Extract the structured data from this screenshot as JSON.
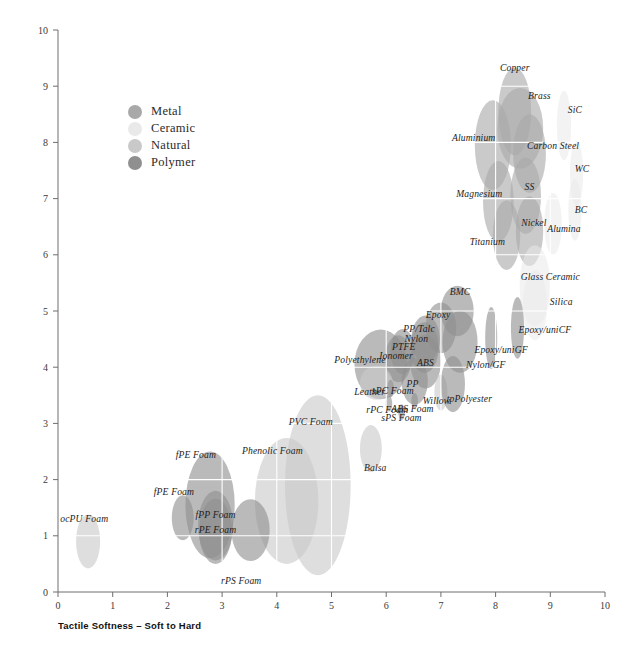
{
  "chart_data": {
    "type": "scatter",
    "title": "",
    "xlabel": "Tactile Softness – Soft to Hard",
    "ylabel": "Tactile Warmth – Warm to Cold",
    "xlim": [
      0,
      10
    ],
    "ylim": [
      0,
      10
    ],
    "xticks": [
      "0",
      "1",
      "2",
      "3",
      "4",
      "5",
      "6",
      "7",
      "8",
      "9",
      "10"
    ],
    "yticks": [
      "0",
      "1",
      "2",
      "3",
      "4",
      "5",
      "6",
      "7",
      "8",
      "9",
      "10"
    ],
    "grid": true,
    "grid_color": "#ffffff",
    "legend_position": "upper-left-inset",
    "note": "Bubble (ellipse) chart; each material is an ellipse whose width/height encode property ranges. Values read off the axes.",
    "legend": [
      {
        "label": "Metal",
        "color": "#a9a9a9"
      },
      {
        "label": "Ceramic",
        "color": "#e9e9e9"
      },
      {
        "label": "Natural",
        "color": "#c9c9c9"
      },
      {
        "label": "Polymer",
        "color": "#8f8f8f"
      }
    ],
    "categories": [
      "Metal",
      "Ceramic",
      "Natural",
      "Polymer"
    ],
    "points": [
      {
        "label": "Copper",
        "category": "Metal",
        "x": 8.35,
        "y": 8.55,
        "rx": 0.3,
        "ry": 0.78,
        "lx": 8.35,
        "ly": 9.35
      },
      {
        "label": "Brass",
        "category": "Metal",
        "x": 8.45,
        "y": 8.25,
        "rx": 0.42,
        "ry": 0.72,
        "lx": 8.8,
        "ly": 8.85
      },
      {
        "label": "Aluminium",
        "category": "Metal",
        "x": 7.95,
        "y": 7.95,
        "rx": 0.33,
        "ry": 0.8,
        "lx": 7.6,
        "ly": 8.1
      },
      {
        "label": "Carbon Steel",
        "category": "Metal",
        "x": 8.62,
        "y": 7.8,
        "rx": 0.3,
        "ry": 0.7,
        "lx": 9.05,
        "ly": 7.95
      },
      {
        "label": "Magnesium",
        "category": "Metal",
        "x": 8.05,
        "y": 6.95,
        "rx": 0.28,
        "ry": 0.72,
        "lx": 7.7,
        "ly": 7.1
      },
      {
        "label": "SS",
        "category": "Metal",
        "x": 8.55,
        "y": 7.05,
        "rx": 0.28,
        "ry": 0.68,
        "lx": 8.62,
        "ly": 7.22
      },
      {
        "label": "Nickel",
        "category": "Metal",
        "x": 8.62,
        "y": 6.42,
        "rx": 0.25,
        "ry": 0.62,
        "lx": 8.7,
        "ly": 6.58
      },
      {
        "label": "Titanium",
        "category": "Metal",
        "x": 8.2,
        "y": 6.35,
        "rx": 0.25,
        "ry": 0.62,
        "lx": 7.85,
        "ly": 6.25
      },
      {
        "label": "SiC",
        "category": "Ceramic",
        "x": 9.25,
        "y": 8.3,
        "rx": 0.13,
        "ry": 0.62,
        "lx": 9.45,
        "ly": 8.6
      },
      {
        "label": "WC",
        "category": "Ceramic",
        "x": 9.48,
        "y": 7.45,
        "rx": 0.12,
        "ry": 0.58,
        "lx": 9.58,
        "ly": 7.55
      },
      {
        "label": "BC",
        "category": "Ceramic",
        "x": 9.45,
        "y": 6.8,
        "rx": 0.12,
        "ry": 0.55,
        "lx": 9.56,
        "ly": 6.82
      },
      {
        "label": "Alumina",
        "category": "Ceramic",
        "x": 9.05,
        "y": 6.55,
        "rx": 0.16,
        "ry": 0.55,
        "lx": 9.25,
        "ly": 6.48
      },
      {
        "label": "Glass Ceramic",
        "category": "Ceramic",
        "x": 8.72,
        "y": 5.45,
        "rx": 0.28,
        "ry": 0.72,
        "lx": 9.0,
        "ly": 5.62
      },
      {
        "label": "Silica",
        "category": "Ceramic",
        "x": 8.72,
        "y": 5.1,
        "rx": 0.22,
        "ry": 0.62,
        "lx": 9.2,
        "ly": 5.18
      },
      {
        "label": "Epoxy/uniCF",
        "category": "Polymer",
        "x": 8.4,
        "y": 4.7,
        "rx": 0.12,
        "ry": 0.55,
        "lx": 8.9,
        "ly": 4.68
      },
      {
        "label": "Epoxy/uniGF",
        "category": "Polymer",
        "x": 7.92,
        "y": 4.52,
        "rx": 0.11,
        "ry": 0.55,
        "lx": 8.1,
        "ly": 4.32
      },
      {
        "label": "BMC",
        "category": "Polymer",
        "x": 7.3,
        "y": 5.0,
        "rx": 0.3,
        "ry": 0.45,
        "lx": 7.35,
        "ly": 5.35
      },
      {
        "label": "Nylon/GF",
        "category": "Polymer",
        "x": 7.35,
        "y": 4.45,
        "rx": 0.32,
        "ry": 0.55,
        "lx": 7.82,
        "ly": 4.05
      },
      {
        "label": "Epoxy",
        "category": "Polymer",
        "x": 7.0,
        "y": 4.7,
        "rx": 0.28,
        "ry": 0.45,
        "lx": 6.95,
        "ly": 4.95
      },
      {
        "label": "PP/Talc",
        "category": "Polymer",
        "x": 6.72,
        "y": 4.5,
        "rx": 0.26,
        "ry": 0.42,
        "lx": 6.6,
        "ly": 4.7
      },
      {
        "label": "Nylon",
        "category": "Polymer",
        "x": 6.7,
        "y": 4.35,
        "rx": 0.26,
        "ry": 0.45,
        "lx": 6.55,
        "ly": 4.52
      },
      {
        "label": "ABS",
        "category": "Polymer",
        "x": 6.72,
        "y": 4.1,
        "rx": 0.28,
        "ry": 0.48,
        "lx": 6.72,
        "ly": 4.1
      },
      {
        "label": "PTFE",
        "category": "Polymer",
        "x": 6.3,
        "y": 4.28,
        "rx": 0.22,
        "ry": 0.4,
        "lx": 6.32,
        "ly": 4.38
      },
      {
        "label": "Ionomer",
        "category": "Polymer",
        "x": 6.22,
        "y": 4.15,
        "rx": 0.24,
        "ry": 0.42,
        "lx": 6.18,
        "ly": 4.22
      },
      {
        "label": "Polyethylene",
        "category": "Polymer",
        "x": 5.9,
        "y": 4.05,
        "rx": 0.48,
        "ry": 0.62,
        "lx": 5.52,
        "ly": 4.15
      },
      {
        "label": "PP",
        "category": "Polymer",
        "x": 6.52,
        "y": 3.75,
        "rx": 0.24,
        "ry": 0.42,
        "lx": 6.48,
        "ly": 3.72
      },
      {
        "label": "Leather",
        "category": "Natural",
        "x": 5.82,
        "y": 3.72,
        "rx": 0.3,
        "ry": 0.3,
        "lx": 5.7,
        "ly": 3.58
      },
      {
        "label": "sPC Foam",
        "category": "Polymer",
        "x": 6.08,
        "y": 3.62,
        "rx": 0.06,
        "ry": 0.16,
        "lx": 6.12,
        "ly": 3.6
      },
      {
        "label": "Willow",
        "category": "Natural",
        "x": 7.0,
        "y": 3.55,
        "rx": 0.12,
        "ry": 0.32,
        "lx": 6.92,
        "ly": 3.42
      },
      {
        "label": "tpPolyester",
        "category": "Polymer",
        "x": 7.22,
        "y": 3.7,
        "rx": 0.22,
        "ry": 0.5,
        "lx": 7.52,
        "ly": 3.45
      },
      {
        "label": "ABS Foam",
        "category": "Polymer",
        "x": 6.52,
        "y": 3.4,
        "rx": 0.06,
        "ry": 0.14,
        "lx": 6.48,
        "ly": 3.28
      },
      {
        "label": "rPC Foam",
        "category": "Polymer",
        "x": 6.05,
        "y": 3.35,
        "rx": 0.06,
        "ry": 0.14,
        "lx": 6.02,
        "ly": 3.25
      },
      {
        "label": "sPS Foam",
        "category": "Polymer",
        "x": 6.28,
        "y": 3.2,
        "rx": 0.06,
        "ry": 0.14,
        "lx": 6.28,
        "ly": 3.12
      },
      {
        "label": "Balsa",
        "category": "Natural",
        "x": 5.72,
        "y": 2.55,
        "rx": 0.2,
        "ry": 0.42,
        "lx": 5.8,
        "ly": 2.22
      },
      {
        "label": "PVC Foam",
        "category": "Natural",
        "x": 4.75,
        "y": 1.9,
        "rx": 0.6,
        "ry": 1.6,
        "lx": 4.62,
        "ly": 3.05
      },
      {
        "label": "Phenolic Foam",
        "category": "Natural",
        "x": 4.18,
        "y": 1.62,
        "rx": 0.58,
        "ry": 1.12,
        "lx": 3.92,
        "ly": 2.52
      },
      {
        "label": "rPS Foam",
        "category": "Polymer",
        "x": 3.52,
        "y": 1.1,
        "rx": 0.35,
        "ry": 0.55,
        "lx": 3.35,
        "ly": 0.22
      },
      {
        "label": "fPE Foam",
        "category": "Polymer",
        "x": 2.78,
        "y": 1.55,
        "rx": 0.45,
        "ry": 0.95,
        "lx": 2.52,
        "ly": 2.45
      },
      {
        "label": "fPE Foam",
        "category": "Polymer",
        "x": 2.28,
        "y": 1.32,
        "rx": 0.2,
        "ry": 0.4,
        "lx": 2.12,
        "ly": 1.8
      },
      {
        "label": "fPP Foam",
        "category": "Polymer",
        "x": 2.88,
        "y": 1.18,
        "rx": 0.32,
        "ry": 0.62,
        "lx": 2.88,
        "ly": 1.38
      },
      {
        "label": "rPE Foam",
        "category": "Polymer",
        "x": 2.88,
        "y": 1.08,
        "rx": 0.3,
        "ry": 0.58,
        "lx": 2.88,
        "ly": 1.12
      },
      {
        "label": "ocPU Foam",
        "category": "Natural",
        "x": 0.55,
        "y": 0.9,
        "rx": 0.22,
        "ry": 0.48,
        "lx": 0.48,
        "ly": 1.32
      }
    ]
  }
}
